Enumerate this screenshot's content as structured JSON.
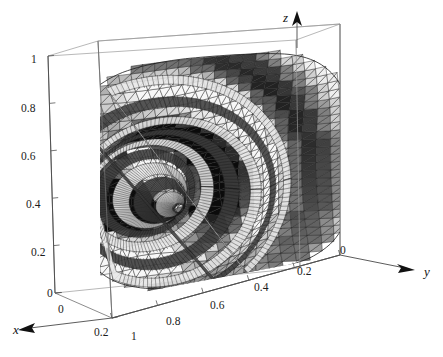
{
  "figure": {
    "kind": "3d-surface-plot",
    "style": "mathematica-grayscale-mesh",
    "background_color": "#ffffff",
    "mesh_line_color": "#2a2a2a",
    "surface_fill_color": "#8a8a8a",
    "surface_fill_light": "#f2f2f2",
    "surface_fill_dark": "#4a4a4a",
    "box_edge_color": "#6f6f6f"
  },
  "axes": {
    "x": {
      "name": "x",
      "ticks": [
        "0",
        "0.2"
      ],
      "tick_values": [
        0,
        0.2
      ],
      "arrow": "left-down",
      "range": [
        0,
        0.2
      ]
    },
    "y": {
      "name": "y",
      "ticks": [
        "1",
        "0.8",
        "0.6",
        "0.4",
        "0.2",
        "0"
      ],
      "tick_values": [
        1,
        0.8,
        0.6,
        0.4,
        0.2,
        0
      ],
      "arrow": "right-down",
      "range": [
        0,
        1
      ]
    },
    "z": {
      "name": "z",
      "ticks": [
        "0",
        "0.2",
        "0.4",
        "0.6",
        "0.8",
        "1"
      ],
      "tick_values": [
        0,
        0.2,
        0.4,
        0.6,
        0.8,
        1
      ],
      "arrow": "up",
      "range": [
        0,
        1
      ]
    }
  },
  "chart_data": {
    "type": "surface",
    "title": "",
    "xlabel": "x",
    "ylabel": "y",
    "zlabel": "z",
    "xlim": [
      0,
      0.2
    ],
    "ylim": [
      0,
      1
    ],
    "zlim": [
      0,
      1
    ],
    "grid": false,
    "legend": "none",
    "x_ticklabels": [
      "0",
      "0.2"
    ],
    "y_ticklabels": [
      "1",
      "0.8",
      "0.6",
      "0.4",
      "0.2",
      "0"
    ],
    "z_ticklabels": [
      "0",
      "0.2",
      "0.4",
      "0.6",
      "0.8",
      "1"
    ],
    "surface_focus": {
      "y": 0.25,
      "z": 0.42
    },
    "ring_count": 9,
    "ring_radii": [
      0.035,
      0.075,
      0.115,
      0.16,
      0.21,
      0.265,
      0.325,
      0.395,
      0.47
    ],
    "mesh_divisions_u": 24,
    "mesh_divisions_v": 24,
    "series": [
      {
        "name": "surface",
        "kind": "oscillatory-radial",
        "values": [
          1.0,
          0.62,
          0.18,
          -0.22,
          -0.46,
          -0.38,
          -0.08,
          0.19,
          0.3,
          0.22,
          0.04,
          -0.12,
          -0.18,
          -0.12,
          0.0,
          0.1,
          0.13,
          0.08,
          0.0,
          -0.06
        ]
      }
    ]
  },
  "labels": {
    "z_ticks": [
      {
        "text": "1",
        "x": 31,
        "y": 63
      },
      {
        "text": "0.8",
        "x": 21,
        "y": 112
      },
      {
        "text": "0.6",
        "x": 21,
        "y": 160
      },
      {
        "text": "0.4",
        "x": 26,
        "y": 208
      },
      {
        "text": "0.2",
        "x": 31,
        "y": 256
      },
      {
        "text": "0",
        "x": 47,
        "y": 297
      }
    ],
    "x_ticks": [
      {
        "text": "0",
        "x": 58,
        "y": 313
      },
      {
        "text": "0.2",
        "x": 94,
        "y": 336
      }
    ],
    "y_ticks": [
      {
        "text": "1",
        "x": 131,
        "y": 340
      },
      {
        "text": "0.8",
        "x": 166,
        "y": 325
      },
      {
        "text": "0.6",
        "x": 210,
        "y": 309
      },
      {
        "text": "0.4",
        "x": 254,
        "y": 291
      },
      {
        "text": "0.2",
        "x": 297,
        "y": 275
      },
      {
        "text": "0",
        "x": 340,
        "y": 254
      }
    ],
    "axis_names": [
      {
        "text": "x",
        "x": 13,
        "y": 334
      },
      {
        "text": "y",
        "x": 424,
        "y": 276
      },
      {
        "text": "z",
        "x": 283,
        "y": 22
      }
    ]
  }
}
